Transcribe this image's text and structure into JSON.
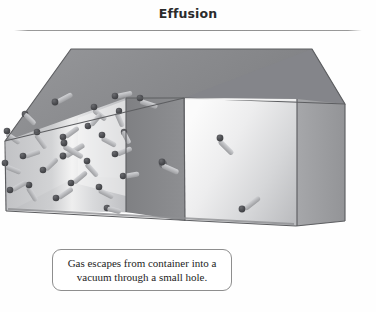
{
  "figure": {
    "title": "Effusion",
    "caption_lines": [
      "Gas escapes from container into a",
      "vacuum through a small hole."
    ],
    "caption_full": "Gas escapes from container into a vacuum through a small hole."
  },
  "colors": {
    "title_text": "#2b2b2b",
    "rule": "#8d8d8d",
    "caption_border": "#8e8e8e",
    "caption_text": "#1d1d1d",
    "page_background": "#fefefe",
    "box_top_face": "#8f9093",
    "box_top_face_dark": "#76777a",
    "box_front_left": "#c3c4c6",
    "box_front_left_highlight": "#f2f2f2",
    "box_front_right": "#d6d7d9",
    "box_front_right_highlight": "#fbfbfb",
    "box_floor": "#a9aaac",
    "box_right_end": "#9fa0a3",
    "partition": "#86878a",
    "edge_line": "#5d5e61",
    "molecule_sphere": "#4a4b4f",
    "molecule_rod": "#b9babd"
  },
  "diagram": {
    "type": "3d-container-illustration",
    "container_label": "gas container",
    "chambers": [
      {
        "name": "left-chamber",
        "state": "filled with gas",
        "molecule_count": 26
      },
      {
        "name": "right-chamber",
        "state": "vacuum",
        "molecule_count": 2
      }
    ],
    "partition": {
      "name": "partition-wall",
      "feature": "small hole",
      "escaping_molecules": 1
    }
  }
}
